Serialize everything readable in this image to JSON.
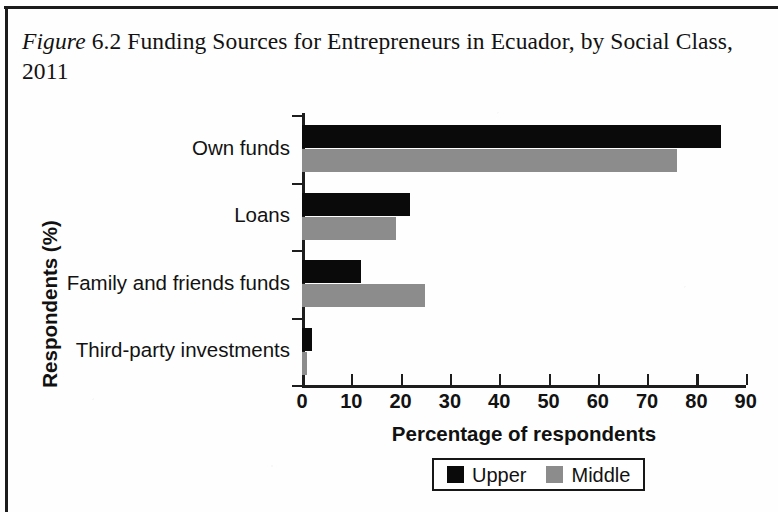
{
  "caption": {
    "figure_word": "Figure",
    "number": "6.2",
    "text": "Funding Sources for Entrepreneurs in Ecuador, by Social Class, 2011",
    "full": "Figure 6.2 Funding Sources for Entrepreneurs in Ecuador, by Social Class, 2011"
  },
  "legend": {
    "items": [
      {
        "label": "Upper",
        "color": "#0a0a0a"
      },
      {
        "label": "Middle",
        "color": "#8c8c8c"
      }
    ]
  },
  "chart_data": {
    "type": "bar",
    "orientation": "horizontal",
    "xlabel": "Percentage of respondents",
    "ylabel": "Respondents (%)",
    "categories": [
      "Own funds",
      "Loans",
      "Family and friends funds",
      "Third-party investments"
    ],
    "series": [
      {
        "name": "Upper",
        "color": "#0a0a0a",
        "values": [
          85,
          22,
          12,
          2
        ]
      },
      {
        "name": "Middle",
        "color": "#8c8c8c",
        "values": [
          76,
          19,
          25,
          1
        ]
      }
    ],
    "xlim": [
      0,
      90
    ],
    "xticks": [
      0,
      10,
      20,
      30,
      40,
      50,
      60,
      70,
      80,
      90
    ],
    "xtick_labels": [
      "0",
      "10",
      "20",
      "30",
      "40",
      "50",
      "60",
      "70",
      "80",
      "90"
    ],
    "grid": false,
    "legend_position": "bottom"
  }
}
